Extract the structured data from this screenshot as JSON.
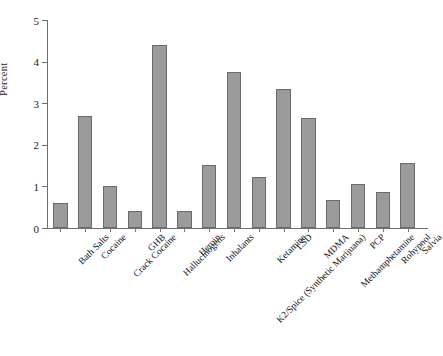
{
  "chart_data": {
    "type": "bar",
    "title": "",
    "xlabel": "",
    "ylabel": "Percent",
    "ylim": [
      0,
      5
    ],
    "yticks": [
      0,
      1,
      2,
      3,
      4,
      5
    ],
    "ytick_labels": [
      "0",
      "1",
      "2",
      "3",
      "4",
      "5"
    ],
    "grid": false,
    "legend": "none",
    "bar_color": "#9b9b9b",
    "bar_edge_color": "#6b6b6b",
    "axis_color": "#6f6f6f",
    "categories": [
      "Bath Salts",
      "Cocaine",
      "Crack Cocaine",
      "GHB",
      "Hallucinogens",
      "Heroin",
      "Inhalants",
      "K2/Spice (Synthetic Marijuana)",
      "Ketamine",
      "LSD",
      "MDMA",
      "Methamphetamine",
      "PCP",
      "Rohypnol",
      "Salvia"
    ],
    "values": [
      0.6,
      2.7,
      1.0,
      0.42,
      4.4,
      0.42,
      1.52,
      3.75,
      1.23,
      3.35,
      2.65,
      0.67,
      1.07,
      0.87,
      1.57
    ]
  }
}
